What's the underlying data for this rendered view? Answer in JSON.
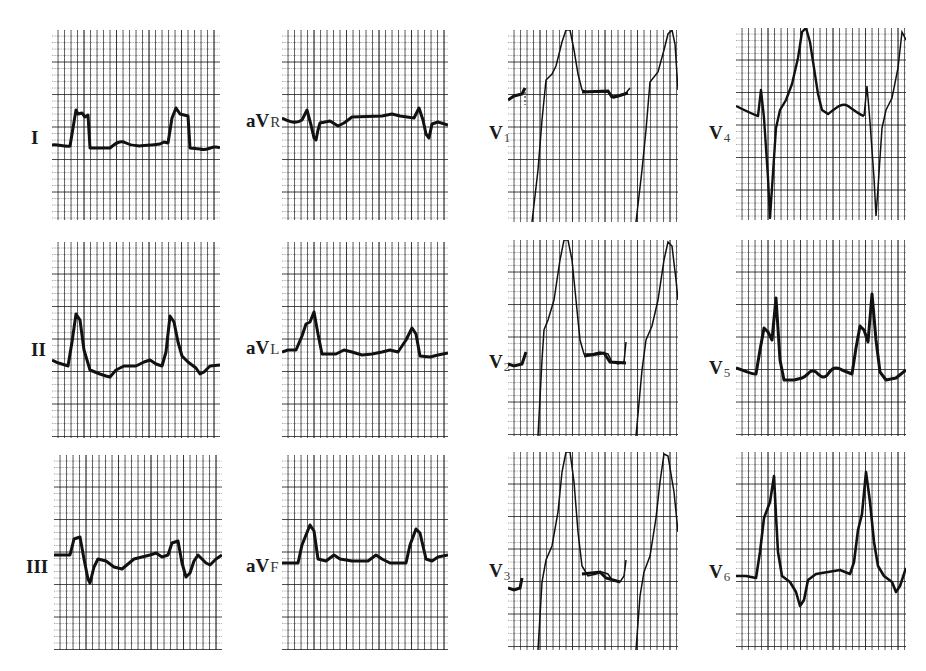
{
  "figure": {
    "grid_color": "#2a2a2a",
    "trace_color": "#111111",
    "background": "#ffffff"
  },
  "leads": [
    {
      "id": "I",
      "label_main": "I",
      "label_sub": "",
      "col": 0,
      "row": 0
    },
    {
      "id": "aVR",
      "label_main": "aV",
      "label_sub": "R",
      "col": 1,
      "row": 0
    },
    {
      "id": "V1",
      "label_main": "V",
      "label_sub": "1",
      "col": 2,
      "row": 0
    },
    {
      "id": "V4",
      "label_main": "V",
      "label_sub": "4",
      "col": 3,
      "row": 0
    },
    {
      "id": "II",
      "label_main": "II",
      "label_sub": "",
      "col": 0,
      "row": 1
    },
    {
      "id": "aVL",
      "label_main": "aV",
      "label_sub": "L",
      "col": 1,
      "row": 1
    },
    {
      "id": "V2",
      "label_main": "V",
      "label_sub": "2",
      "col": 2,
      "row": 1
    },
    {
      "id": "V5",
      "label_main": "V",
      "label_sub": "5",
      "col": 3,
      "row": 1
    },
    {
      "id": "III",
      "label_main": "III",
      "label_sub": "",
      "col": 0,
      "row": 2
    },
    {
      "id": "aVF",
      "label_main": "aV",
      "label_sub": "F",
      "col": 1,
      "row": 2
    },
    {
      "id": "V3",
      "label_main": "V",
      "label_sub": "3",
      "col": 2,
      "row": 2
    },
    {
      "id": "V6",
      "label_main": "V",
      "label_sub": "6",
      "col": 3,
      "row": 2
    }
  ]
}
